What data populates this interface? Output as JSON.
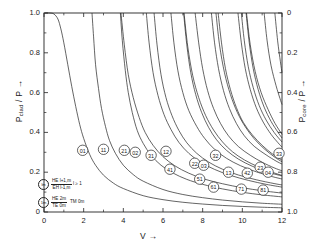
{
  "chart_data": {
    "type": "line",
    "title": "",
    "xlabel": "V",
    "ylabel_left": "P_clad / P",
    "ylabel_right": "P_core / P",
    "xlim": [
      0,
      12
    ],
    "ylim_left": [
      0,
      1.0
    ],
    "ylim_right": [
      1.0,
      0
    ],
    "grid": false,
    "legend_position": "inside-bottom-left",
    "xticks": [
      "0",
      "2",
      "4",
      "6",
      "8",
      "10",
      "12"
    ],
    "xtick_values": [
      0,
      2,
      4,
      6,
      8,
      10,
      12
    ],
    "yticks_left": [
      "0",
      "0.2",
      "0.4",
      "0.6",
      "0.8",
      "1.0"
    ],
    "ytick_values_left": [
      0,
      0.2,
      0.4,
      0.6,
      0.8,
      1.0
    ],
    "yticks_right": [
      "0",
      "0.2",
      "0.4",
      "0.6",
      "0.8",
      "1.0"
    ],
    "ytick_values_right": [
      0,
      0.2,
      0.4,
      0.6,
      0.8,
      1.0
    ],
    "series": [
      {
        "name": "01",
        "label": "01",
        "cutoff_v": 0.0,
        "label_point": [
          1.95,
          0.31
        ],
        "points": [
          [
            0.05,
            1.0
          ],
          [
            0.3,
            1.0
          ],
          [
            0.5,
            0.995
          ],
          [
            0.7,
            0.97
          ],
          [
            0.85,
            0.92
          ],
          [
            1.0,
            0.85
          ],
          [
            1.2,
            0.74
          ],
          [
            1.4,
            0.63
          ],
          [
            1.6,
            0.53
          ],
          [
            1.8,
            0.44
          ],
          [
            2.0,
            0.37
          ],
          [
            2.3,
            0.29
          ],
          [
            2.6,
            0.235
          ],
          [
            3.0,
            0.185
          ],
          [
            3.5,
            0.145
          ],
          [
            4.0,
            0.118
          ],
          [
            5.0,
            0.082
          ],
          [
            6.0,
            0.062
          ],
          [
            7.0,
            0.049
          ],
          [
            8.0,
            0.04
          ],
          [
            9.0,
            0.033
          ],
          [
            10.0,
            0.028
          ],
          [
            11.0,
            0.024
          ],
          [
            12.0,
            0.021
          ]
        ]
      },
      {
        "name": "11",
        "label": "11",
        "cutoff_v": 2.405,
        "label_point": [
          3.0,
          0.315
        ],
        "points": [
          [
            2.42,
            1.0
          ],
          [
            2.5,
            0.88
          ],
          [
            2.6,
            0.74
          ],
          [
            2.75,
            0.62
          ],
          [
            2.9,
            0.52
          ],
          [
            3.1,
            0.43
          ],
          [
            3.3,
            0.36
          ],
          [
            3.6,
            0.295
          ],
          [
            4.0,
            0.235
          ],
          [
            4.5,
            0.188
          ],
          [
            5.0,
            0.155
          ],
          [
            6.0,
            0.113
          ],
          [
            7.0,
            0.088
          ],
          [
            8.0,
            0.072
          ],
          [
            9.0,
            0.06
          ],
          [
            10.0,
            0.051
          ],
          [
            11.0,
            0.044
          ],
          [
            12.0,
            0.039
          ]
        ]
      },
      {
        "name": "21",
        "label": "21",
        "cutoff_v": 3.832,
        "label_point": [
          4.05,
          0.31
        ],
        "points": [
          [
            3.85,
            1.0
          ],
          [
            3.95,
            0.86
          ],
          [
            4.1,
            0.71
          ],
          [
            4.25,
            0.6
          ],
          [
            4.45,
            0.5
          ],
          [
            4.7,
            0.41
          ],
          [
            5.0,
            0.345
          ],
          [
            5.4,
            0.285
          ],
          [
            5.9,
            0.235
          ],
          [
            6.5,
            0.196
          ],
          [
            7.2,
            0.164
          ],
          [
            8.0,
            0.139
          ],
          [
            9.0,
            0.116
          ],
          [
            10.0,
            0.099
          ],
          [
            11.0,
            0.086
          ],
          [
            12.0,
            0.076
          ]
        ]
      },
      {
        "name": "02",
        "label": "02",
        "cutoff_v": 3.832,
        "label_point": [
          4.6,
          0.3
        ],
        "points": [
          [
            3.88,
            1.0
          ],
          [
            4.05,
            0.84
          ],
          [
            4.25,
            0.69
          ],
          [
            4.5,
            0.575
          ],
          [
            4.8,
            0.475
          ],
          [
            5.1,
            0.4
          ],
          [
            5.5,
            0.335
          ],
          [
            6.0,
            0.278
          ],
          [
            6.6,
            0.232
          ],
          [
            7.3,
            0.195
          ],
          [
            8.1,
            0.165
          ],
          [
            9.0,
            0.142
          ],
          [
            10.0,
            0.122
          ],
          [
            11.0,
            0.107
          ],
          [
            12.0,
            0.095
          ]
        ]
      },
      {
        "name": "31",
        "label": "31",
        "cutoff_v": 5.136,
        "label_point": [
          5.4,
          0.285
        ],
        "points": [
          [
            5.16,
            1.0
          ],
          [
            5.3,
            0.85
          ],
          [
            5.5,
            0.7
          ],
          [
            5.75,
            0.585
          ],
          [
            6.05,
            0.49
          ],
          [
            6.4,
            0.415
          ],
          [
            6.8,
            0.35
          ],
          [
            7.3,
            0.295
          ],
          [
            7.9,
            0.25
          ],
          [
            8.6,
            0.214
          ],
          [
            9.4,
            0.184
          ],
          [
            10.3,
            0.159
          ],
          [
            11.2,
            0.139
          ],
          [
            12.0,
            0.125
          ]
        ]
      },
      {
        "name": "12",
        "label": "12",
        "cutoff_v": 5.52,
        "label_point": [
          6.15,
          0.305
        ],
        "points": [
          [
            5.55,
            1.0
          ],
          [
            5.7,
            0.84
          ],
          [
            5.9,
            0.69
          ],
          [
            6.15,
            0.575
          ],
          [
            6.45,
            0.485
          ],
          [
            6.8,
            0.41
          ],
          [
            7.2,
            0.348
          ],
          [
            7.7,
            0.295
          ],
          [
            8.3,
            0.251
          ],
          [
            9.0,
            0.215
          ],
          [
            9.8,
            0.186
          ],
          [
            10.7,
            0.162
          ],
          [
            11.6,
            0.143
          ],
          [
            12.0,
            0.136
          ]
        ]
      },
      {
        "name": "41",
        "label": "41",
        "cutoff_v": 6.38,
        "label_point": [
          6.35,
          0.215
        ],
        "points": [
          [
            6.4,
            1.0
          ],
          [
            6.55,
            0.85
          ],
          [
            6.75,
            0.71
          ],
          [
            7.0,
            0.6
          ],
          [
            7.3,
            0.51
          ],
          [
            7.7,
            0.43
          ],
          [
            8.1,
            0.37
          ],
          [
            8.6,
            0.315
          ],
          [
            9.2,
            0.27
          ],
          [
            9.9,
            0.233
          ],
          [
            10.7,
            0.202
          ],
          [
            11.5,
            0.178
          ],
          [
            12.0,
            0.166
          ]
        ]
      },
      {
        "name": "22",
        "label": "22",
        "cutoff_v": 7.016,
        "label_point": [
          7.6,
          0.245
        ],
        "points": [
          [
            7.04,
            1.0
          ],
          [
            7.2,
            0.84
          ],
          [
            7.4,
            0.7
          ],
          [
            7.65,
            0.59
          ],
          [
            7.95,
            0.5
          ],
          [
            8.3,
            0.425
          ],
          [
            8.7,
            0.363
          ],
          [
            9.2,
            0.31
          ],
          [
            9.8,
            0.266
          ],
          [
            10.5,
            0.23
          ],
          [
            11.3,
            0.2
          ],
          [
            12.0,
            0.181
          ]
        ]
      },
      {
        "name": "03",
        "label": "03",
        "cutoff_v": 7.016,
        "label_point": [
          8.05,
          0.235
        ],
        "points": [
          [
            7.06,
            1.0
          ],
          [
            7.25,
            0.83
          ],
          [
            7.5,
            0.685
          ],
          [
            7.8,
            0.575
          ],
          [
            8.15,
            0.485
          ],
          [
            8.55,
            0.412
          ],
          [
            9.0,
            0.352
          ],
          [
            9.5,
            0.303
          ],
          [
            10.1,
            0.262
          ],
          [
            10.8,
            0.227
          ],
          [
            11.5,
            0.2
          ],
          [
            12.0,
            0.184
          ]
        ]
      },
      {
        "name": "51",
        "label": "51",
        "cutoff_v": 7.59,
        "label_point": [
          7.85,
          0.165
        ],
        "points": [
          [
            7.62,
            1.0
          ],
          [
            7.8,
            0.85
          ],
          [
            8.0,
            0.72
          ],
          [
            8.25,
            0.61
          ],
          [
            8.55,
            0.52
          ],
          [
            8.9,
            0.445
          ],
          [
            9.3,
            0.383
          ],
          [
            9.8,
            0.329
          ],
          [
            10.4,
            0.285
          ],
          [
            11.0,
            0.25
          ],
          [
            11.6,
            0.222
          ],
          [
            12.0,
            0.207
          ]
        ]
      },
      {
        "name": "32",
        "label": "32",
        "cutoff_v": 8.417,
        "label_point": [
          8.65,
          0.285
        ],
        "points": [
          [
            8.44,
            1.0
          ],
          [
            8.6,
            0.85
          ],
          [
            8.8,
            0.72
          ],
          [
            9.05,
            0.61
          ],
          [
            9.35,
            0.52
          ],
          [
            9.7,
            0.445
          ],
          [
            10.1,
            0.383
          ],
          [
            10.6,
            0.33
          ],
          [
            11.2,
            0.287
          ],
          [
            11.7,
            0.256
          ],
          [
            12.0,
            0.241
          ]
        ]
      },
      {
        "name": "61",
        "label": "61",
        "cutoff_v": 8.77,
        "label_point": [
          8.55,
          0.125
        ],
        "points": [
          [
            8.78,
            1.0
          ],
          [
            8.95,
            0.85
          ],
          [
            9.15,
            0.72
          ],
          [
            9.4,
            0.615
          ],
          [
            9.7,
            0.525
          ],
          [
            10.05,
            0.45
          ],
          [
            10.5,
            0.388
          ],
          [
            11.0,
            0.335
          ],
          [
            11.5,
            0.293
          ],
          [
            12.0,
            0.26
          ]
        ]
      },
      {
        "name": "13",
        "label": "13",
        "cutoff_v": 8.654,
        "label_point": [
          9.3,
          0.2
        ],
        "points": [
          [
            8.67,
            1.0
          ],
          [
            8.85,
            0.84
          ],
          [
            9.1,
            0.7
          ],
          [
            9.4,
            0.59
          ],
          [
            9.75,
            0.5
          ],
          [
            10.15,
            0.428
          ],
          [
            10.6,
            0.368
          ],
          [
            11.1,
            0.318
          ],
          [
            11.6,
            0.278
          ],
          [
            12.0,
            0.252
          ]
        ]
      },
      {
        "name": "42",
        "label": "42",
        "cutoff_v": 9.761,
        "label_point": [
          10.25,
          0.195
        ],
        "points": [
          [
            9.78,
            1.0
          ],
          [
            9.95,
            0.85
          ],
          [
            10.15,
            0.72
          ],
          [
            10.4,
            0.615
          ],
          [
            10.7,
            0.525
          ],
          [
            11.05,
            0.452
          ],
          [
            11.45,
            0.39
          ],
          [
            11.8,
            0.348
          ],
          [
            12.0,
            0.326
          ]
        ]
      },
      {
        "name": "71",
        "label": "71",
        "cutoff_v": 9.936,
        "label_point": [
          9.95,
          0.115
        ],
        "points": [
          [
            9.95,
            1.0
          ],
          [
            10.1,
            0.86
          ],
          [
            10.3,
            0.73
          ],
          [
            10.55,
            0.625
          ],
          [
            10.85,
            0.535
          ],
          [
            11.2,
            0.462
          ],
          [
            11.6,
            0.4
          ],
          [
            12.0,
            0.352
          ]
        ]
      },
      {
        "name": "23",
        "label": "23",
        "cutoff_v": 10.17,
        "label_point": [
          10.9,
          0.225
        ],
        "points": [
          [
            10.19,
            1.0
          ],
          [
            10.35,
            0.85
          ],
          [
            10.55,
            0.72
          ],
          [
            10.8,
            0.615
          ],
          [
            11.1,
            0.527
          ],
          [
            11.45,
            0.455
          ],
          [
            11.8,
            0.4
          ],
          [
            12.0,
            0.372
          ]
        ]
      },
      {
        "name": "04",
        "label": "04",
        "cutoff_v": 10.17,
        "label_point": [
          11.3,
          0.2
        ],
        "points": [
          [
            10.21,
            1.0
          ],
          [
            10.4,
            0.84
          ],
          [
            10.65,
            0.705
          ],
          [
            10.95,
            0.6
          ],
          [
            11.3,
            0.515
          ],
          [
            11.65,
            0.445
          ],
          [
            12.0,
            0.39
          ]
        ]
      },
      {
        "name": "81",
        "label": "81",
        "cutoff_v": 11.086,
        "label_point": [
          11.05,
          0.11
        ],
        "points": [
          [
            11.1,
            1.0
          ],
          [
            11.25,
            0.86
          ],
          [
            11.45,
            0.735
          ],
          [
            11.7,
            0.635
          ],
          [
            11.9,
            0.57
          ],
          [
            12.0,
            0.54
          ]
        ]
      },
      {
        "name": "33",
        "label": "33",
        "cutoff_v": 11.62,
        "label_point": [
          11.85,
          0.295
        ],
        "points": [
          [
            11.64,
            1.0
          ],
          [
            11.78,
            0.86
          ],
          [
            11.92,
            0.755
          ],
          [
            12.0,
            0.7
          ]
        ]
      }
    ],
    "legend_entries": [
      {
        "symbol": "lm",
        "circled": true,
        "formula_num": "HE l+1,m",
        "formula_den": "EH l-1,m",
        "formula_tail": "l ≥ 1"
      },
      {
        "symbol": "1m",
        "circled": true,
        "formula_num": "HE 2m",
        "formula_den": "TE 0m",
        "formula_tail": "TM 0m"
      }
    ]
  }
}
